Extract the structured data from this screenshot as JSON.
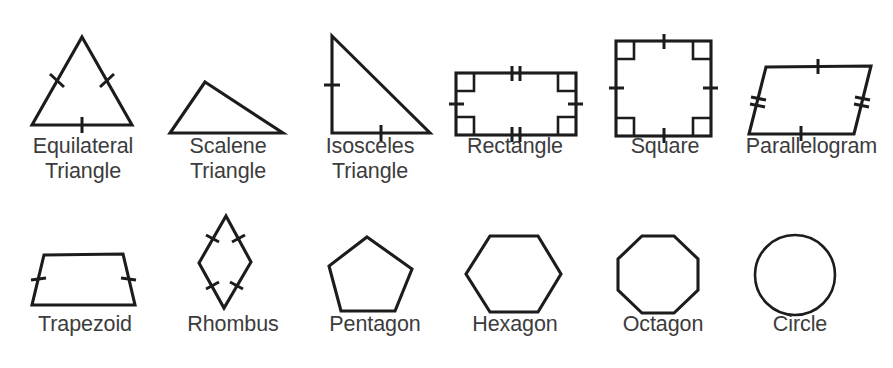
{
  "page": {
    "background_color": "#ffffff",
    "stroke_color": "#1c1c1c",
    "label_color": "#3c3c3c",
    "rows": 2,
    "columns": 6
  },
  "shapes": [
    {
      "id": "equilateral-triangle",
      "label": "Equilateral\nTriangle",
      "row": 1,
      "column": 1,
      "sides": 3,
      "tick_marks": "single tick on all three sides",
      "right_angle_marks": 0
    },
    {
      "id": "scalene-triangle",
      "label": "Scalene\nTriangle",
      "row": 1,
      "column": 2,
      "sides": 3,
      "tick_marks": "none",
      "right_angle_marks": 0
    },
    {
      "id": "isosceles-triangle",
      "label": "Isosceles\nTriangle",
      "row": 1,
      "column": 3,
      "sides": 3,
      "tick_marks": "single tick on vertical leg and horizontal leg",
      "right_angle_marks": 0
    },
    {
      "id": "rectangle",
      "label": "Rectangle",
      "row": 1,
      "column": 4,
      "sides": 4,
      "tick_marks": "double ticks on top and bottom, single ticks on left and right",
      "right_angle_marks": 4
    },
    {
      "id": "square",
      "label": "Square",
      "row": 1,
      "column": 5,
      "sides": 4,
      "tick_marks": "single tick on all four sides",
      "right_angle_marks": 4
    },
    {
      "id": "parallelogram",
      "label": "Parallelogram",
      "row": 1,
      "column": 6,
      "sides": 4,
      "tick_marks": "single ticks on top and bottom, double ticks on left and right",
      "right_angle_marks": 0
    },
    {
      "id": "trapezoid",
      "label": "Trapezoid",
      "row": 2,
      "column": 1,
      "sides": 4,
      "tick_marks": "single tick on both slanted legs",
      "right_angle_marks": 0
    },
    {
      "id": "rhombus",
      "label": "Rhombus",
      "row": 2,
      "column": 2,
      "sides": 4,
      "tick_marks": "single tick on all four sides",
      "right_angle_marks": 0
    },
    {
      "id": "pentagon",
      "label": "Pentagon",
      "row": 2,
      "column": 3,
      "sides": 5,
      "tick_marks": "none",
      "right_angle_marks": 0
    },
    {
      "id": "hexagon",
      "label": "Hexagon",
      "row": 2,
      "column": 4,
      "sides": 6,
      "tick_marks": "none",
      "right_angle_marks": 0
    },
    {
      "id": "octagon",
      "label": "Octagon",
      "row": 2,
      "column": 5,
      "sides": 8,
      "tick_marks": "none",
      "right_angle_marks": 0
    },
    {
      "id": "circle",
      "label": "Circle",
      "row": 2,
      "column": 6,
      "sides": 0,
      "tick_marks": "none",
      "right_angle_marks": 0
    }
  ]
}
